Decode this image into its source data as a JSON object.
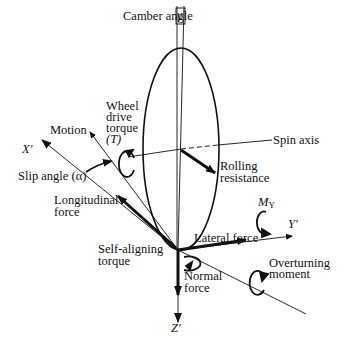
{
  "figure": {
    "type": "tire-axis-system-diagram",
    "labels": {
      "camber_angle": "Camber angle",
      "camber_symbol": "γ",
      "wheel_drive_torque_l1": "Wheel",
      "wheel_drive_torque_l2": "drive",
      "wheel_drive_torque_l3": "torque",
      "wheel_drive_torque_l4": "(T)",
      "motion": "Motion",
      "x_axis": "X′",
      "slip_angle": "Slip angle (α)",
      "spin_axis": "Spin axis",
      "rolling_resistance_l1": "Rolling",
      "rolling_resistance_l2": "resistance",
      "longitudinal_force_l1": "Longitudinal",
      "longitudinal_force_l2": "force",
      "m_y": "M",
      "m_y_sub": "Y",
      "y_axis": "Y′",
      "lateral_force": "Lateral force",
      "self_aligning_l1": "Self-aligning",
      "self_aligning_l2": "torque",
      "normal_force_l1": "Normal",
      "normal_force_l2": "force",
      "overturning_l1": "Overturning",
      "overturning_l2": "moment",
      "z_axis": "Z′"
    },
    "colors": {
      "ink": "#111111",
      "background": "#ffffff"
    }
  }
}
